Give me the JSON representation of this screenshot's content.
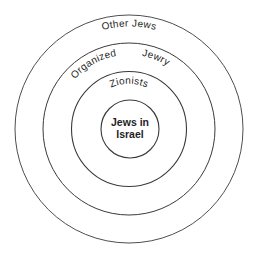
{
  "diagram": {
    "type": "concentric-circles",
    "rings": [
      {
        "id": "outer",
        "label": "Other Jews"
      },
      {
        "id": "second",
        "label_part1": "Organized",
        "label_part2": "Jewry"
      },
      {
        "id": "third",
        "label": "Zionists"
      },
      {
        "id": "core",
        "label_line1": "Jews in",
        "label_line2": "Israel"
      }
    ],
    "stroke_color": "#3a3a3a",
    "text_color": "#1f1f1f",
    "background": "#ffffff"
  }
}
